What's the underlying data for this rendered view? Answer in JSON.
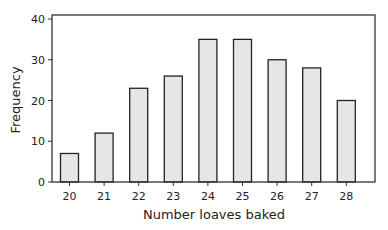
{
  "chart_data": {
    "type": "bar",
    "title": "",
    "xlabel": "Number loaves baked",
    "ylabel": "Frequency",
    "categories": [
      "20",
      "21",
      "22",
      "23",
      "24",
      "25",
      "26",
      "27",
      "28"
    ],
    "values": [
      7,
      12,
      23,
      26,
      35,
      35,
      30,
      28,
      20
    ],
    "ylim": [
      0,
      40
    ],
    "yticks": [
      0,
      10,
      20,
      30,
      40
    ],
    "grid": false,
    "legend": null,
    "bar_fill": "#e6e6e6",
    "bar_stroke": "#222222"
  }
}
